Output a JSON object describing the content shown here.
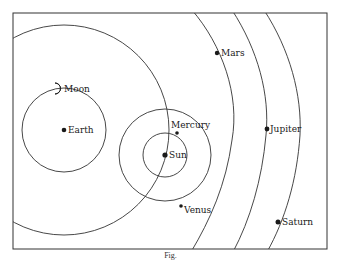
{
  "diagram": {
    "colors": {
      "line": "#333333",
      "dot": "#1a1a1a",
      "background": "#ffffff"
    },
    "bodies": [
      {
        "name": "Sun",
        "label": "Sun",
        "x": 165,
        "y": 155
      },
      {
        "name": "Mercury",
        "label": "Mercury",
        "x": 177,
        "y": 133
      },
      {
        "name": "Venus",
        "label": "Venus",
        "x": 181,
        "y": 206
      },
      {
        "name": "Earth",
        "label": "Earth",
        "x": 64,
        "y": 130
      },
      {
        "name": "Moon",
        "label": "Moon",
        "x": 57,
        "y": 88
      },
      {
        "name": "Mars",
        "label": "Mars",
        "x": 217,
        "y": 53
      },
      {
        "name": "Jupiter",
        "label": "Jupiter",
        "x": 267,
        "y": 129
      },
      {
        "name": "Saturn",
        "label": "Saturn",
        "x": 278,
        "y": 222
      }
    ],
    "labels": {
      "sun": "Sun",
      "mercury": "Mercury",
      "venus": "Venus",
      "earth": "Earth",
      "moon": "Moon",
      "mars": "Mars",
      "jupiter": "Jupiter",
      "saturn": "Saturn"
    },
    "caption": "Fig."
  }
}
